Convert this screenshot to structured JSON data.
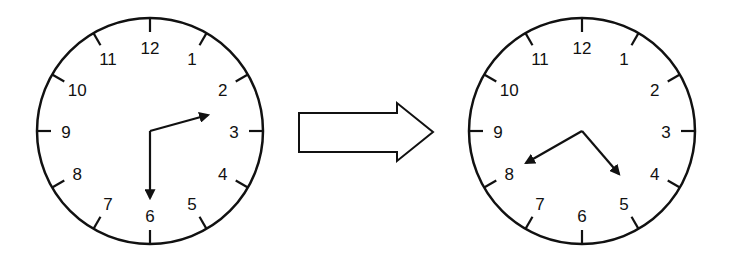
{
  "diagram": {
    "stroke_color": "#111111",
    "background": "#ffffff",
    "left_clock": {
      "numbers": [
        "12",
        "1",
        "2",
        "3",
        "4",
        "5",
        "6",
        "7",
        "8",
        "9",
        "10",
        "11"
      ],
      "hands": [
        {
          "name": "hand-a",
          "points_toward": "between 2 and 3"
        },
        {
          "name": "hand-b",
          "points_toward": "6"
        }
      ]
    },
    "arrow": {
      "direction": "right",
      "style": "hollow block arrow"
    },
    "right_clock": {
      "numbers": [
        "12",
        "1",
        "2",
        "3",
        "4",
        "5",
        "6",
        "7",
        "8",
        "9",
        "10",
        "11"
      ],
      "hands": [
        {
          "name": "hand-a",
          "points_toward": "8"
        },
        {
          "name": "hand-b",
          "points_toward": "between 4 and 5"
        }
      ]
    }
  }
}
